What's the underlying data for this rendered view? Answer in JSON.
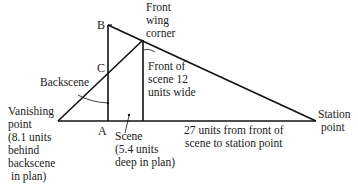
{
  "diagram": {
    "points": {
      "B": "B",
      "C": "C",
      "A": "A"
    },
    "labels": {
      "front_wing_corner": [
        "Front",
        "wing",
        "corner"
      ],
      "backscene": "Backscene",
      "front_of_scene": [
        "Front of",
        "scene 12",
        "units wide"
      ],
      "vanishing_point": [
        "Vanishing",
        "point",
        "(8.1 units",
        "behind",
        "backscene",
        "in plan)"
      ],
      "scene": [
        "Scene",
        "(5.4 units",
        "deep in plan)"
      ],
      "distance": [
        "27 units from front of",
        "scene to station point"
      ],
      "station_point": [
        "Station",
        "point"
      ]
    },
    "colors": {
      "line": "#111111",
      "text": "#1a1a1a",
      "background": "#ffffff"
    }
  }
}
